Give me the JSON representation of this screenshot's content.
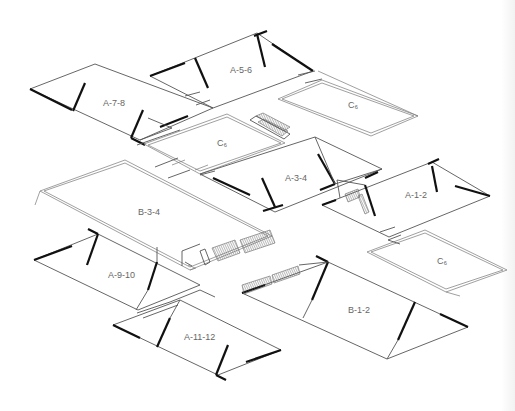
{
  "diagram": {
    "type": "axonometric-building-layout",
    "background": "#ffffff",
    "line_color": "#555555",
    "wall_color": "#111111",
    "blocks": [
      {
        "id": "A-5-6",
        "label": "A-5-6",
        "kind": "gabled",
        "label_pos": [
          238,
          72
        ]
      },
      {
        "id": "A-7-8",
        "label": "A-7-8",
        "kind": "gabled",
        "label_pos": [
          103,
          106
        ]
      },
      {
        "id": "C-upper-right",
        "label": "C₆",
        "kind": "courtyard",
        "label_pos": [
          351,
          106
        ]
      },
      {
        "id": "C-middle",
        "label": "C₆",
        "kind": "courtyard",
        "label_pos": [
          218,
          145
        ]
      },
      {
        "id": "A-3-4",
        "label": "A-3-4",
        "kind": "gabled",
        "label_pos": [
          285,
          180
        ]
      },
      {
        "id": "A-1-2",
        "label": "A-1-2",
        "kind": "gabled",
        "label_pos": [
          405,
          196
        ]
      },
      {
        "id": "B-3-4",
        "label": "B-3-4",
        "kind": "flat-slab",
        "label_pos": [
          138,
          213
        ]
      },
      {
        "id": "C-lower-right",
        "label": "C₆",
        "kind": "courtyard",
        "label_pos": [
          439,
          262
        ]
      },
      {
        "id": "A-9-10",
        "label": "A-9-10",
        "kind": "gabled",
        "label_pos": [
          108,
          277
        ]
      },
      {
        "id": "B-1-2",
        "label": "B-1-2",
        "kind": "gabled",
        "label_pos": [
          350,
          310
        ]
      },
      {
        "id": "A-11-12",
        "label": "A-11-12",
        "kind": "gabled",
        "label_pos": [
          184,
          338
        ]
      }
    ],
    "stairs": [
      {
        "id": "stair-near-C-middle",
        "position": "top edge of central courtyard"
      },
      {
        "id": "stair-near-A-1-2",
        "position": "left end of A-1-2"
      },
      {
        "id": "stair-B-3-4-front",
        "position": "front edge of B-3-4"
      },
      {
        "id": "stair-B-1-2-left",
        "position": "left edge of B-1-2"
      }
    ]
  }
}
